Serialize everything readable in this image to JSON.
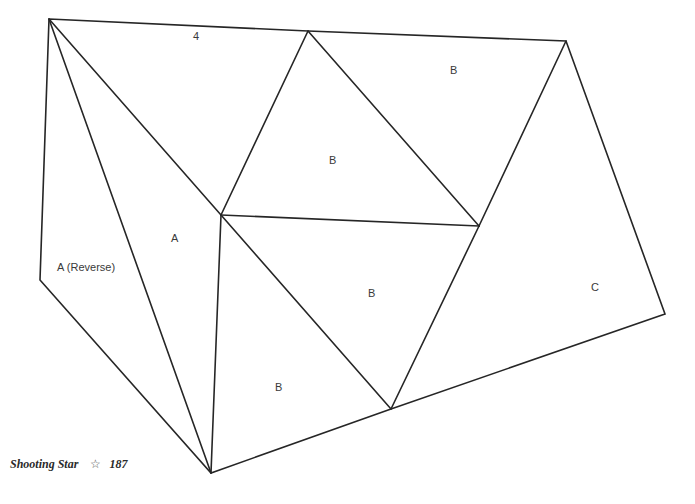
{
  "caption": {
    "title": "Shooting Star",
    "star_glyph": "☆",
    "page_number": "187"
  },
  "diagram": {
    "vertices": {
      "P1": [
        49,
        19
      ],
      "P2": [
        308,
        31
      ],
      "P3": [
        566,
        41
      ],
      "P4": [
        221,
        215
      ],
      "P5": [
        479,
        226
      ],
      "P6": [
        40,
        280
      ],
      "P7": [
        211,
        473
      ],
      "P8": [
        391,
        409
      ],
      "P9": [
        665,
        314
      ]
    },
    "labels": [
      {
        "id": "region-4",
        "text": "4",
        "x": 196,
        "y": 40
      },
      {
        "id": "region-b-top-right",
        "text": "B",
        "x": 454,
        "y": 74
      },
      {
        "id": "region-b-center-upper",
        "text": "B",
        "x": 333,
        "y": 163
      },
      {
        "id": "region-a",
        "text": "A",
        "x": 175,
        "y": 241
      },
      {
        "id": "region-a-reverse",
        "text": "A (Reverse)",
        "x": 58,
        "y": 270
      },
      {
        "id": "region-b-center-lower",
        "text": "B",
        "x": 372,
        "y": 296
      },
      {
        "id": "region-c",
        "text": "C",
        "x": 595,
        "y": 290
      },
      {
        "id": "region-b-bottom",
        "text": "B",
        "x": 279,
        "y": 390
      }
    ]
  }
}
